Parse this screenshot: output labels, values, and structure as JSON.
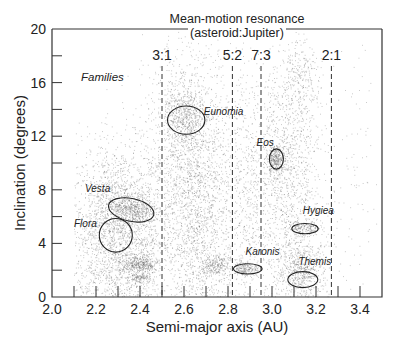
{
  "chart_data": {
    "type": "scatter",
    "title": "Mean-motion resonance (asteroid:Jupiter)",
    "title_line1": "Mean-motion resonance",
    "title_line2": "(asteroid:Jupiter)",
    "xlabel": "Semi-major axis (AU)",
    "ylabel": "Inclination (degrees)",
    "xlim": [
      2.0,
      3.5
    ],
    "ylim": [
      0,
      20
    ],
    "x_ticks": [
      "2.0",
      "2.2",
      "2.4",
      "2.6",
      "2.8",
      "3.0",
      "3.2",
      "3.4"
    ],
    "x_tick_values": [
      2.0,
      2.2,
      2.4,
      2.6,
      2.8,
      3.0,
      3.2,
      3.4
    ],
    "x_minor_ticks": [
      2.1,
      2.3,
      2.5,
      2.7,
      2.9,
      3.1,
      3.3
    ],
    "y_ticks": [
      "0",
      "4",
      "8",
      "12",
      "16",
      "20"
    ],
    "y_tick_values": [
      0,
      4,
      8,
      12,
      16,
      20
    ],
    "y_minor_ticks": [
      2,
      6,
      10,
      14,
      18
    ],
    "grid": false,
    "annotation_heading": "Families",
    "resonances": [
      {
        "label": "3:1",
        "a": 2.5
      },
      {
        "label": "5:2",
        "a": 2.82
      },
      {
        "label": "7:3",
        "a": 2.95
      },
      {
        "label": "2:1",
        "a": 3.27
      }
    ],
    "families": [
      {
        "name": "Vesta",
        "a": 2.36,
        "i": 6.5,
        "da": 0.105,
        "di": 0.85,
        "rot": 12,
        "label_a": 2.15,
        "label_i": 7.8
      },
      {
        "name": "Flora",
        "a": 2.29,
        "i": 4.6,
        "da": 0.075,
        "di": 1.25,
        "rot": 0,
        "label_a": 2.1,
        "label_i": 5.2
      },
      {
        "name": "Eunomia",
        "a": 2.61,
        "i": 13.2,
        "da": 0.085,
        "di": 1.05,
        "rot": 0,
        "label_a": 2.69,
        "label_i": 13.6
      },
      {
        "name": "Eos",
        "a": 3.02,
        "i": 10.3,
        "da": 0.032,
        "di": 0.75,
        "rot": 0,
        "label_a": 2.93,
        "label_i": 11.3
      },
      {
        "name": "Karonis",
        "a": 2.89,
        "i": 2.1,
        "da": 0.065,
        "di": 0.38,
        "rot": 0,
        "label_a": 2.88,
        "label_i": 3.1
      },
      {
        "name": "Hygiea",
        "a": 3.15,
        "i": 5.1,
        "da": 0.06,
        "di": 0.38,
        "rot": 0,
        "label_a": 3.14,
        "label_i": 6.2
      },
      {
        "name": "Themis",
        "a": 3.14,
        "i": 1.3,
        "da": 0.068,
        "di": 0.6,
        "rot": 0,
        "label_a": 3.12,
        "label_i": 2.4
      }
    ],
    "density_clusters": [
      {
        "a": 2.3,
        "i": 5.0,
        "sa": 0.12,
        "si": 3.2,
        "n": 2600
      },
      {
        "a": 2.36,
        "i": 6.5,
        "sa": 0.06,
        "si": 0.6,
        "n": 500
      },
      {
        "a": 2.4,
        "i": 2.4,
        "sa": 0.04,
        "si": 0.35,
        "n": 350
      },
      {
        "a": 2.4,
        "i": 1.4,
        "sa": 0.025,
        "si": 0.2,
        "n": 120
      },
      {
        "a": 2.62,
        "i": 11.0,
        "sa": 0.1,
        "si": 4.0,
        "n": 1600
      },
      {
        "a": 2.6,
        "i": 13.5,
        "sa": 0.05,
        "si": 1.0,
        "n": 450
      },
      {
        "a": 2.68,
        "i": 5.0,
        "sa": 0.08,
        "si": 3.5,
        "n": 1000
      },
      {
        "a": 2.74,
        "i": 2.3,
        "sa": 0.03,
        "si": 0.4,
        "n": 200
      },
      {
        "a": 2.88,
        "i": 8.0,
        "sa": 0.05,
        "si": 5.0,
        "n": 350
      },
      {
        "a": 2.87,
        "i": 2.1,
        "sa": 0.03,
        "si": 0.25,
        "n": 220
      },
      {
        "a": 3.05,
        "i": 9.0,
        "sa": 0.09,
        "si": 4.5,
        "n": 1500
      },
      {
        "a": 3.02,
        "i": 10.3,
        "sa": 0.02,
        "si": 0.5,
        "n": 300
      },
      {
        "a": 3.12,
        "i": 16.0,
        "sa": 0.05,
        "si": 1.5,
        "n": 250
      },
      {
        "a": 3.14,
        "i": 2.0,
        "sa": 0.06,
        "si": 1.0,
        "n": 600
      },
      {
        "a": 3.15,
        "i": 5.1,
        "sa": 0.04,
        "si": 0.3,
        "n": 180
      },
      {
        "a": 3.4,
        "i": 10.0,
        "sa": 0.08,
        "si": 5.0,
        "n": 90
      }
    ]
  }
}
